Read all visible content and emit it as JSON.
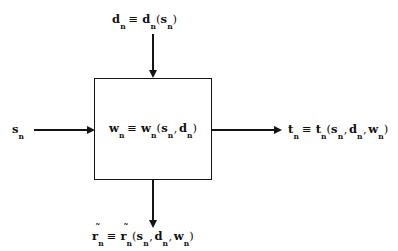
{
  "diagram": {
    "background_color": "#ffffff",
    "line_color": "#141414",
    "block": {
      "name": "stage-n-block",
      "label_parts": {
        "lhs_var": "w",
        "lhs_sub": "n",
        "equiv": "≡",
        "rhs_var": "w",
        "rhs_sub": "n",
        "open_paren": "(",
        "arg1_var": "s",
        "arg1_sub": "n",
        "comma1": ",",
        "arg2_var": "d",
        "arg2_sub": "n",
        "close_paren": ")"
      },
      "label_text": "w_n ≡ w_n(s_n , d_n)"
    },
    "inputs": [
      {
        "name": "decision-input",
        "position": "top",
        "label_parts": {
          "lhs_var": "d",
          "lhs_sub": "n",
          "equiv": "≡",
          "rhs_var": "d",
          "rhs_sub": "n",
          "open_paren": "(",
          "arg1_var": "s",
          "arg1_sub": "n",
          "close_paren": ")"
        },
        "label_text": "d_n ≡ d_n(s_n)"
      },
      {
        "name": "state-input",
        "position": "left",
        "label_parts": {
          "lhs_var": "s",
          "lhs_sub": "n"
        },
        "label_text": "s_n"
      }
    ],
    "outputs": [
      {
        "name": "transition-output",
        "position": "right",
        "label_parts": {
          "lhs_var": "t",
          "lhs_sub": "n",
          "equiv": "≡",
          "rhs_var": "t",
          "rhs_sub": "n",
          "open_paren": "(",
          "arg1_var": "s",
          "arg1_sub": "n",
          "comma1": ",",
          "arg2_var": "d",
          "arg2_sub": "n",
          "comma2": ",",
          "arg3_var": "w",
          "arg3_sub": "n",
          "close_paren": ")"
        },
        "label_text": "t_n ≡ t_n(s_n , d_n , w_n)"
      },
      {
        "name": "reward-output",
        "position": "bottom",
        "accent": "˜",
        "label_parts": {
          "lhs_var": "r",
          "lhs_sub": "n",
          "equiv": "≡",
          "rhs_var": "r",
          "rhs_sub": "n",
          "open_paren": "(",
          "arg1_var": "s",
          "arg1_sub": "n",
          "comma1": ",",
          "arg2_var": "d",
          "arg2_sub": "n",
          "comma2": ",",
          "arg3_var": "w",
          "arg3_sub": "n",
          "close_paren": ")"
        },
        "label_text": "r̃_n ≡ r̃_n(s_n , d_n , w_n)"
      }
    ]
  }
}
